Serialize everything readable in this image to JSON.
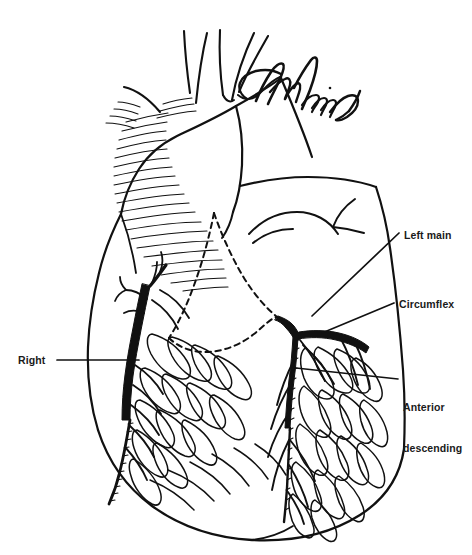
{
  "figure": {
    "type": "medical-line-illustration",
    "background_color": "#ffffff",
    "ink_color": "#111111",
    "width": 472,
    "height": 555
  },
  "labels": {
    "left_main": "Left main",
    "circumflex": "Circumflex",
    "anterior_descending_line1": "Anterior",
    "anterior_descending_line2": "descending",
    "right": "Right"
  },
  "annotation": {
    "signature_present": true,
    "signature_description": "handwritten signature in ink"
  },
  "structures": [
    "aortic arch",
    "brachiocephalic branch vessels",
    "pulmonary artery (dashed outline)",
    "right atrium",
    "right ventricle",
    "left ventricle",
    "right coronary artery",
    "left main coronary artery",
    "circumflex artery",
    "left anterior descending artery",
    "epicardial fat pads"
  ]
}
